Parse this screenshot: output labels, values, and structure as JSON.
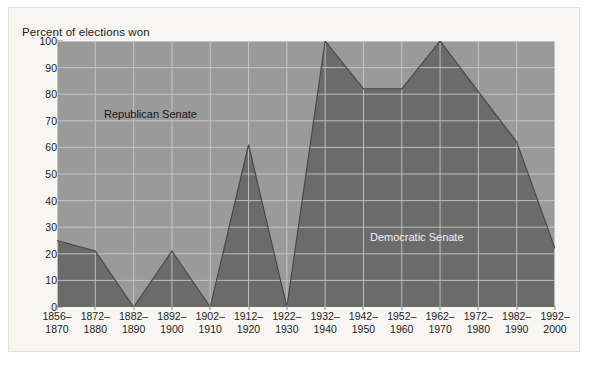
{
  "chart_data": {
    "type": "area",
    "title": "",
    "ylabel": "Percent of elections won",
    "xlabel": "",
    "ylim": [
      0,
      100
    ],
    "ytick_step": 10,
    "yticks": [
      100,
      90,
      80,
      70,
      60,
      50,
      40,
      30,
      20,
      10,
      0
    ],
    "grid": true,
    "categories": [
      "1856–\n1870",
      "1872–\n1880",
      "1882–\n1890",
      "1892–\n1900",
      "1902–\n1910",
      "1912–\n1920",
      "1922–\n1930",
      "1932–\n1940",
      "1942–\n1950",
      "1952–\n1960",
      "1962–\n1970",
      "1972–\n1980",
      "1982–\n1990",
      "1992–\n2000"
    ],
    "categories_split": [
      {
        "top": "1856–",
        "bottom": "1870"
      },
      {
        "top": "1872–",
        "bottom": "1880"
      },
      {
        "top": "1882–",
        "bottom": "1890"
      },
      {
        "top": "1892–",
        "bottom": "1900"
      },
      {
        "top": "1902–",
        "bottom": "1910"
      },
      {
        "top": "1912–",
        "bottom": "1920"
      },
      {
        "top": "1922–",
        "bottom": "1930"
      },
      {
        "top": "1932–",
        "bottom": "1940"
      },
      {
        "top": "1942–",
        "bottom": "1950"
      },
      {
        "top": "1952–",
        "bottom": "1960"
      },
      {
        "top": "1962–",
        "bottom": "1970"
      },
      {
        "top": "1972–",
        "bottom": "1980"
      },
      {
        "top": "1982–",
        "bottom": "1990"
      },
      {
        "top": "1992–",
        "bottom": "2000"
      }
    ],
    "series": [
      {
        "name": "Democratic Senate",
        "color": "#6b6b6b",
        "label_color": "#f0f0f0",
        "values": [
          25,
          21,
          0,
          21,
          0,
          61,
          0,
          100,
          82,
          82,
          100,
          81,
          62,
          22
        ]
      },
      {
        "name": "Republican Senate",
        "color": "#9a9a9a",
        "label_color": "#161616",
        "values": [
          75,
          79,
          100,
          79,
          100,
          39,
          100,
          0,
          18,
          18,
          0,
          19,
          38,
          78
        ]
      }
    ],
    "legend_position": "inline-annotations",
    "annotations": [
      {
        "text": "Republican Senate",
        "x_category_index": 2,
        "y_value": 73
      },
      {
        "text": "Democratic Senate",
        "x_category_index": 9,
        "y_value": 27
      }
    ],
    "colors": {
      "republican_area": "#9a9a9a",
      "democratic_area": "#6b6b6b",
      "gridline": "#cbcbcb",
      "series_outline": "#4a4a4a",
      "background": "#f7f6f2",
      "text": "#1d1d1d"
    }
  }
}
